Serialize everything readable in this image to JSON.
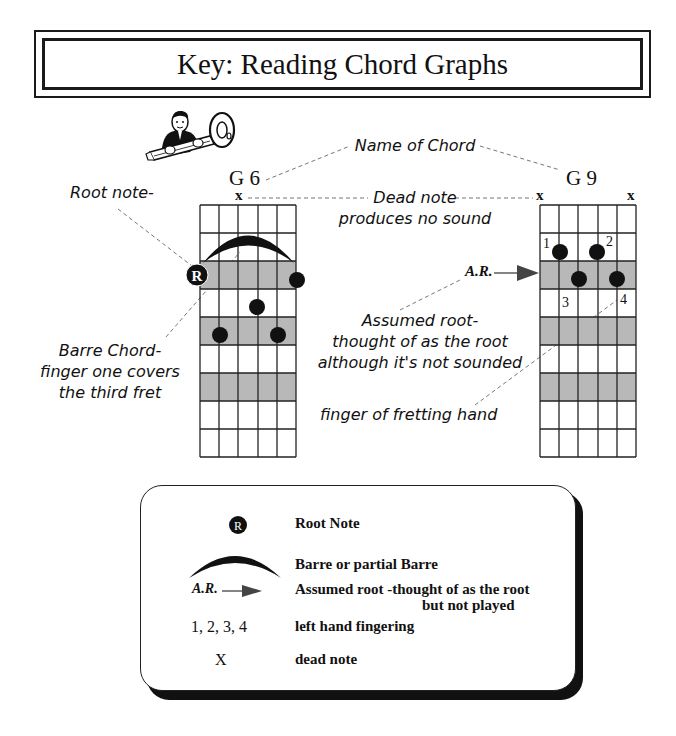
{
  "title": "Key: Reading Chord Graphs",
  "colors": {
    "ink": "#111111",
    "shade": "#b8b8b8",
    "paper": "#ffffff"
  },
  "icons": {
    "mascot": "man-holding-key-icon"
  },
  "annotations": {
    "name_of_chord": "Name of Chord",
    "root_note": "Root note-",
    "dead_note_line1": "Dead note",
    "dead_note_line2": "produces no sound",
    "barre_line1": "Barre Chord-",
    "barre_line2": "finger one covers",
    "barre_line3": "the third fret",
    "assumed_root_line1": "Assumed root-",
    "assumed_root_line2": "thought of as the root",
    "assumed_root_line3": "although it's not sounded",
    "finger_label": "finger of fretting hand"
  },
  "chords": [
    {
      "name": "G 6",
      "dead_strings_label": [
        "x"
      ],
      "grid": {
        "strings": 6,
        "frets": 9,
        "shaded_rows": [
          2,
          4,
          6
        ]
      },
      "barre": {
        "fret": 2,
        "from_string": 1,
        "to_string": 6
      },
      "root_marker": {
        "label": "R",
        "string": 1,
        "fret": 3
      },
      "dots": [
        {
          "string": 6,
          "fret": 3
        },
        {
          "string": 4,
          "fret": 4
        },
        {
          "string": 2,
          "fret": 5
        },
        {
          "string": 5,
          "fret": 5
        }
      ]
    },
    {
      "name": "G 9",
      "dead_strings_label": [
        "x",
        "x"
      ],
      "grid": {
        "strings": 6,
        "frets": 9,
        "shaded_rows": [
          2,
          4,
          6
        ]
      },
      "assumed_root_label": "A.R.",
      "dots": [
        {
          "string": 2,
          "fret": 2,
          "finger": "1"
        },
        {
          "string": 4,
          "fret": 2,
          "finger": "2"
        },
        {
          "string": 3,
          "fret": 3,
          "finger": "3"
        },
        {
          "string": 5,
          "fret": 3,
          "finger": "4"
        }
      ]
    }
  ],
  "legend": {
    "items": [
      {
        "symbol": "R",
        "symbol_type": "root-note-icon",
        "description": "Root Note"
      },
      {
        "symbol": "",
        "symbol_type": "barre-arc-icon",
        "description": "Barre or partial Barre"
      },
      {
        "symbol": "A.R.",
        "symbol_type": "assumed-root-arrow-icon",
        "description": "Assumed root -thought of as the root",
        "description_line2": "but not played"
      },
      {
        "symbol": "1, 2, 3, 4",
        "symbol_type": "text",
        "description": "left hand fingering"
      },
      {
        "symbol": "X",
        "symbol_type": "text",
        "description": "dead note"
      }
    ]
  }
}
